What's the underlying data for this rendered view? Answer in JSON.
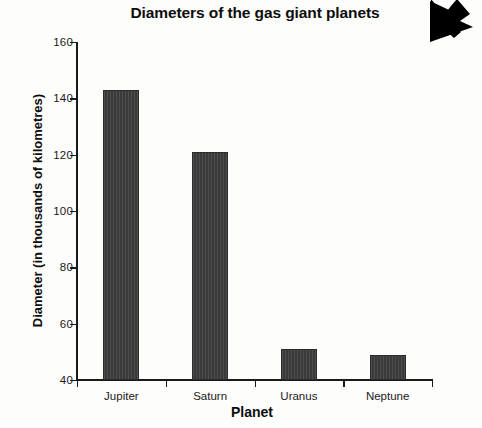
{
  "chart_data": {
    "type": "bar",
    "title": "Diameters of the gas giant planets",
    "xlabel": "Planet",
    "ylabel": "Diameter (in thousands of kilometres)",
    "categories": [
      "Jupiter",
      "Saturn",
      "Uranus",
      "Neptune"
    ],
    "values": [
      143,
      121,
      51,
      49
    ],
    "ylim": [
      40,
      160
    ],
    "ytick_labels": [
      "40",
      "60",
      "80",
      "100",
      "120",
      "140",
      "160"
    ],
    "ytick_values": [
      40,
      60,
      80,
      100,
      120,
      140,
      160
    ],
    "grid": false,
    "legend": null,
    "bar_color": "#3a3a3a",
    "axis_color": "#1a1a1a",
    "background_color": "#fdfdfc"
  },
  "overlay": {
    "cursor_icon": "arrow-down-left-cursor",
    "cursor_color": "#000000"
  }
}
